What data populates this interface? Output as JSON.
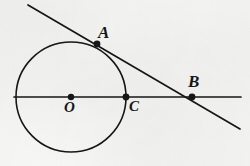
{
  "figure": {
    "kind": "geometry-diagram",
    "width": 250,
    "height": 166,
    "background_color": "#f7f7f5",
    "ink_color": "#161616"
  },
  "labels": {
    "a": "A",
    "b": "B",
    "o": "O",
    "c": "C"
  },
  "geometry": {
    "circle": {
      "cx": 71,
      "cy": 97,
      "r": 55,
      "stroke_width": 1.6
    },
    "points": [
      {
        "name": "A",
        "x": 97,
        "y": 44,
        "radius": 3.4,
        "on": "circle-and-tangent-line"
      },
      {
        "name": "B",
        "x": 192,
        "y": 97,
        "radius": 3.4,
        "on": "horizontal-line-and-tangent-line"
      },
      {
        "name": "O",
        "x": 71,
        "y": 97,
        "radius": 3.2,
        "on": "circle-centre"
      },
      {
        "name": "C",
        "x": 126,
        "y": 97,
        "radius": 3.4,
        "on": "circle-and-horizontal-line"
      }
    ],
    "lines": [
      {
        "name": "horizontal-diameter-line",
        "x1": 14,
        "y1": 97,
        "x2": 241,
        "y2": 97,
        "stroke_width": 1.7
      },
      {
        "name": "tangent-secant-line",
        "x1": 28,
        "y1": 5,
        "x2": 240,
        "y2": 129,
        "stroke_width": 1.7
      }
    ]
  }
}
